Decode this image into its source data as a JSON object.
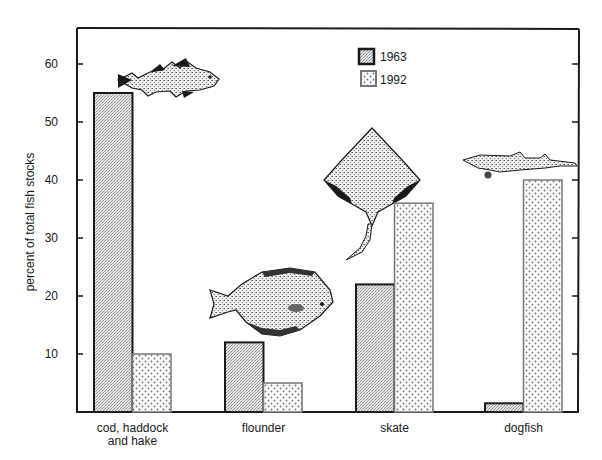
{
  "chart_data": {
    "type": "bar",
    "title": "",
    "xlabel": "",
    "ylabel": "percent of total fish stocks",
    "ylim": [
      0,
      65
    ],
    "yticks": [
      10,
      20,
      30,
      40,
      50,
      60
    ],
    "grid": false,
    "legend_position": "top-right (inside plot)",
    "categories": [
      "cod, haddock and hake",
      "flounder",
      "skate",
      "dogfish"
    ],
    "category_lines": [
      [
        "cod, haddock",
        "and hake"
      ],
      [
        "flounder"
      ],
      [
        "skate"
      ],
      [
        "dogfish"
      ]
    ],
    "series": [
      {
        "name": "1963",
        "values": [
          55,
          12,
          22,
          1.5
        ],
        "pattern": "fine-stipple",
        "fill": "#dcdcdc",
        "stroke": "#1a1a1a"
      },
      {
        "name": "1992",
        "values": [
          10,
          5,
          36,
          40
        ],
        "pattern": "dots",
        "fill": "#f4f4f4",
        "stroke": "#777777"
      }
    ],
    "annotations": [
      {
        "type": "illustration",
        "label": "cod-fish-illustration",
        "near": "cod, haddock and hake"
      },
      {
        "type": "illustration",
        "label": "flounder-illustration",
        "near": "flounder"
      },
      {
        "type": "illustration",
        "label": "skate-illustration",
        "near": "skate"
      },
      {
        "type": "illustration",
        "label": "dogfish-illustration",
        "near": "dogfish"
      }
    ]
  },
  "legend": {
    "items": [
      {
        "label": "1963"
      },
      {
        "label": "1992"
      }
    ]
  }
}
